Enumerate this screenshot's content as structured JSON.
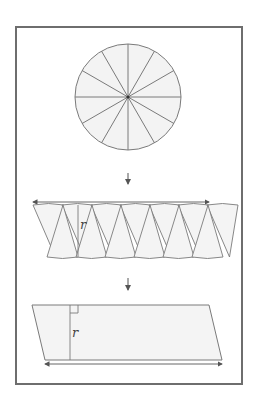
{
  "figure": {
    "colors": {
      "stroke": "#7a7a7a",
      "fill": "#f2f2f2",
      "frame": "#6e6e6e"
    },
    "circle": {
      "sectors": 12
    },
    "step1": {
      "arrow": "↓",
      "height_label": "r"
    },
    "step2": {
      "arrow": "↓",
      "height_label": "r"
    }
  }
}
